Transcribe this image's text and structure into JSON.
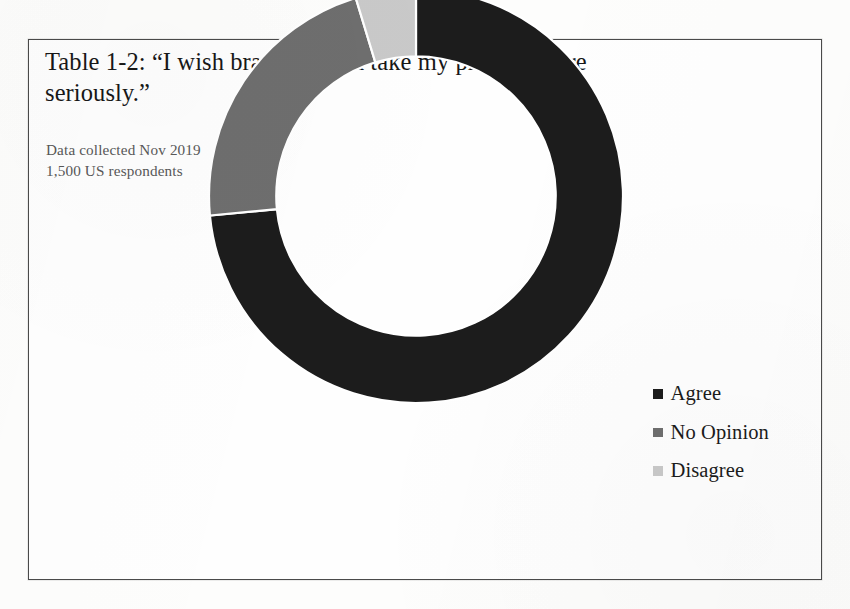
{
  "figure": {
    "title_line1": "Table 1-2: “I wish brands would take my privacy more",
    "title_line2": "seriously.”",
    "subtitle_line1": "Data collected Nov 2019",
    "subtitle_line2": "1,500 US respondents",
    "background_color": "#fefefe",
    "border_color": "#4a4a4a"
  },
  "legend": {
    "position": "right",
    "items": [
      {
        "label": "Agree",
        "color": "#1c1c1c",
        "swatch_name": "legend-swatch-agree"
      },
      {
        "label": "No Opinion",
        "color": "#6e6e6e",
        "swatch_name": "legend-swatch-no-opinion"
      },
      {
        "label": "Disagree",
        "color": "#c9c9c9",
        "swatch_name": "legend-swatch-disagree"
      }
    ]
  },
  "chart_data": {
    "type": "pie",
    "variant": "donut",
    "title": "Table 1-2: “I wish brands would take my privacy more seriously.”",
    "subtitle": "Data collected Nov 2019 / 1,500 US respondents",
    "xlabel": "",
    "ylabel": "",
    "categories": [
      "Agree",
      "No Opinion",
      "Disagree"
    ],
    "values": [
      73.5,
      21.8,
      4.7
    ],
    "value_unit": "percent",
    "colors": [
      "#1c1c1c",
      "#6e6e6e",
      "#c9c9c9"
    ],
    "start_angle_deg": 0,
    "direction": "clockwise",
    "segment_angles_deg": [
      264.6,
      78.5,
      16.9
    ],
    "inner_radius_ratio": 0.675,
    "grid": false,
    "legend_position": "right",
    "data_labels_shown": false,
    "annotations": []
  },
  "geometry": {
    "center_x": 405,
    "center_y": 355,
    "outer_radius": 207,
    "inner_radius": 140,
    "separator_color": "#ffffff"
  }
}
